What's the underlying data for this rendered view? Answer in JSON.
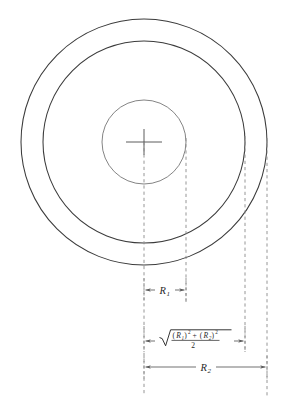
{
  "figure": {
    "type": "technical-diagram",
    "background_color": "#ffffff",
    "stroke_color": "#3b3b3b",
    "dashed_color": "#8a8a8a",
    "center": {
      "x": 144,
      "y": 142
    },
    "circles": [
      {
        "name": "inner-circle",
        "radius": 42,
        "role": "R1 boundary"
      },
      {
        "name": "middle-circle",
        "radius": 101,
        "role": "rms radius boundary"
      },
      {
        "name": "outer-circle",
        "radius": 123,
        "role": "R2 boundary"
      }
    ],
    "projection_lines": [
      {
        "name": "center-axis",
        "x": 144
      },
      {
        "name": "r1-edge",
        "x": 186
      },
      {
        "name": "rms-edge",
        "x": 245
      },
      {
        "name": "r2-edge",
        "x": 267
      }
    ],
    "dimensions": [
      {
        "id": "dim-r1",
        "label": "R",
        "subscript": "1",
        "from_x": 144,
        "to_x": 186,
        "y": 290
      },
      {
        "id": "dim-rms",
        "label_type": "radical-fraction",
        "numerator_parts": [
          {
            "text": "(",
            "style": "upright"
          },
          {
            "text": "R",
            "style": "italic"
          },
          {
            "text": "1",
            "style": "subscript"
          },
          {
            "text": ")",
            "style": "upright"
          },
          {
            "text": "2",
            "style": "superscript"
          },
          {
            "text": "+",
            "style": "upright"
          },
          {
            "text": "(",
            "style": "upright"
          },
          {
            "text": "R",
            "style": "italic"
          },
          {
            "text": "2",
            "style": "subscript"
          },
          {
            "text": ")",
            "style": "upright"
          },
          {
            "text": "2",
            "style": "superscript"
          }
        ],
        "numerator_plain": "(R1)2 + (R2)2",
        "denominator": "2",
        "from_x": 144,
        "to_x": 245,
        "y": 341
      },
      {
        "id": "dim-r2",
        "label": "R",
        "subscript": "2",
        "from_x": 144,
        "to_x": 267,
        "y": 367
      }
    ],
    "crosshair": {
      "name": "center-mark",
      "half_width": 18,
      "half_height": 13
    }
  },
  "caption": {
    "text": ""
  }
}
